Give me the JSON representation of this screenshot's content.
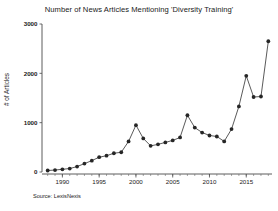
{
  "chart_data": {
    "type": "line",
    "title": "Number of News Articles Mentioning 'Diversity Training'",
    "xlabel": "",
    "ylabel": "# of Articles",
    "source": "Source: LexisNexis",
    "xlim": [
      1987.5,
      2018.5
    ],
    "ylim": [
      0,
      3000
    ],
    "grid": false,
    "legend": null,
    "marker": "filled-circle",
    "ytick_labels": [
      "0",
      "1000",
      "2000",
      "3000"
    ],
    "ytick_values": [
      0,
      1000,
      2000,
      3000
    ],
    "xtick_labels": [
      "1990",
      "1995",
      "2000",
      "2005",
      "2010",
      "2015"
    ],
    "xtick_values": [
      1990,
      1995,
      2000,
      2005,
      2010,
      2015
    ],
    "x": [
      1988,
      1989,
      1990,
      1991,
      1992,
      1993,
      1994,
      1995,
      1996,
      1997,
      1998,
      1999,
      2000,
      2001,
      2002,
      2003,
      2004,
      2005,
      2006,
      2007,
      2008,
      2009,
      2010,
      2011,
      2012,
      2013,
      2014,
      2015,
      2016,
      2017,
      2018
    ],
    "values": [
      30,
      40,
      55,
      70,
      110,
      170,
      230,
      300,
      330,
      380,
      400,
      620,
      950,
      680,
      530,
      560,
      600,
      640,
      700,
      1150,
      900,
      800,
      740,
      720,
      620,
      870,
      1330,
      1950,
      1520,
      1530,
      2650
    ],
    "series": [
      {
        "name": "# of Articles",
        "color": "#262626",
        "values": [
          30,
          40,
          55,
          70,
          110,
          170,
          230,
          300,
          330,
          380,
          400,
          620,
          950,
          680,
          530,
          560,
          600,
          640,
          700,
          1150,
          900,
          800,
          740,
          720,
          620,
          870,
          1330,
          1950,
          1520,
          1530,
          2650
        ]
      }
    ]
  }
}
